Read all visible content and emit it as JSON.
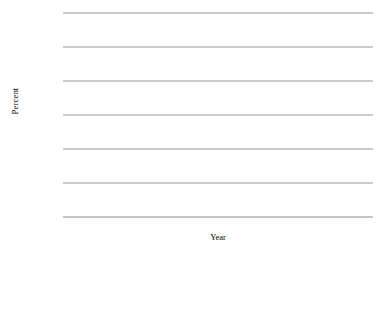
{
  "chart_data": {
    "type": "line",
    "title": "",
    "xlabel": "Year",
    "ylabel": "Percent",
    "categories": [
      "1918",
      "1922",
      "1925",
      "1928",
      "1932",
      "1937"
    ],
    "ylim": [
      0,
      60
    ],
    "yticks": [
      0,
      10,
      20,
      30,
      40,
      50,
      60
    ],
    "ytick_labels": [
      "0",
      "10",
      "20",
      "30",
      "40",
      "50",
      "60"
    ],
    "grid": "horizontal",
    "legend_position": "below-plot-left",
    "series": [
      {
        "name": "Government",
        "style": "thick-solid",
        "color": "#000000",
        "values": [
          38.5,
          49.5,
          33.3,
          37.0,
          35.5,
          35.3
        ]
      },
      {
        "name": "Patients",
        "style": "thick-dashed",
        "color": "#000000",
        "values": [
          7.0,
          10.5,
          18.0,
          25.8,
          36.8,
          43.2
        ]
      },
      {
        "name": "Voluntary",
        "style": "thin-solid",
        "color": "#000000",
        "values": [
          20.8,
          10.6,
          10.3,
          8.3,
          6.6,
          4.8
        ]
      },
      {
        "name": "Other",
        "style": "thin-dashed",
        "color": "#000000",
        "values": [
          31.5,
          24.2,
          45.0,
          26.4,
          18.2,
          16.0
        ]
      }
    ]
  },
  "legend": {
    "items": [
      {
        "label": "Government",
        "key": "thick-solid-line-icon"
      },
      {
        "label": "Patients",
        "key": "thick-dashed-line-icon"
      },
      {
        "label": "Voluntary",
        "key": "thin-solid-line-icon"
      },
      {
        "label": "Other",
        "key": "thin-dashed-line-icon"
      }
    ]
  }
}
